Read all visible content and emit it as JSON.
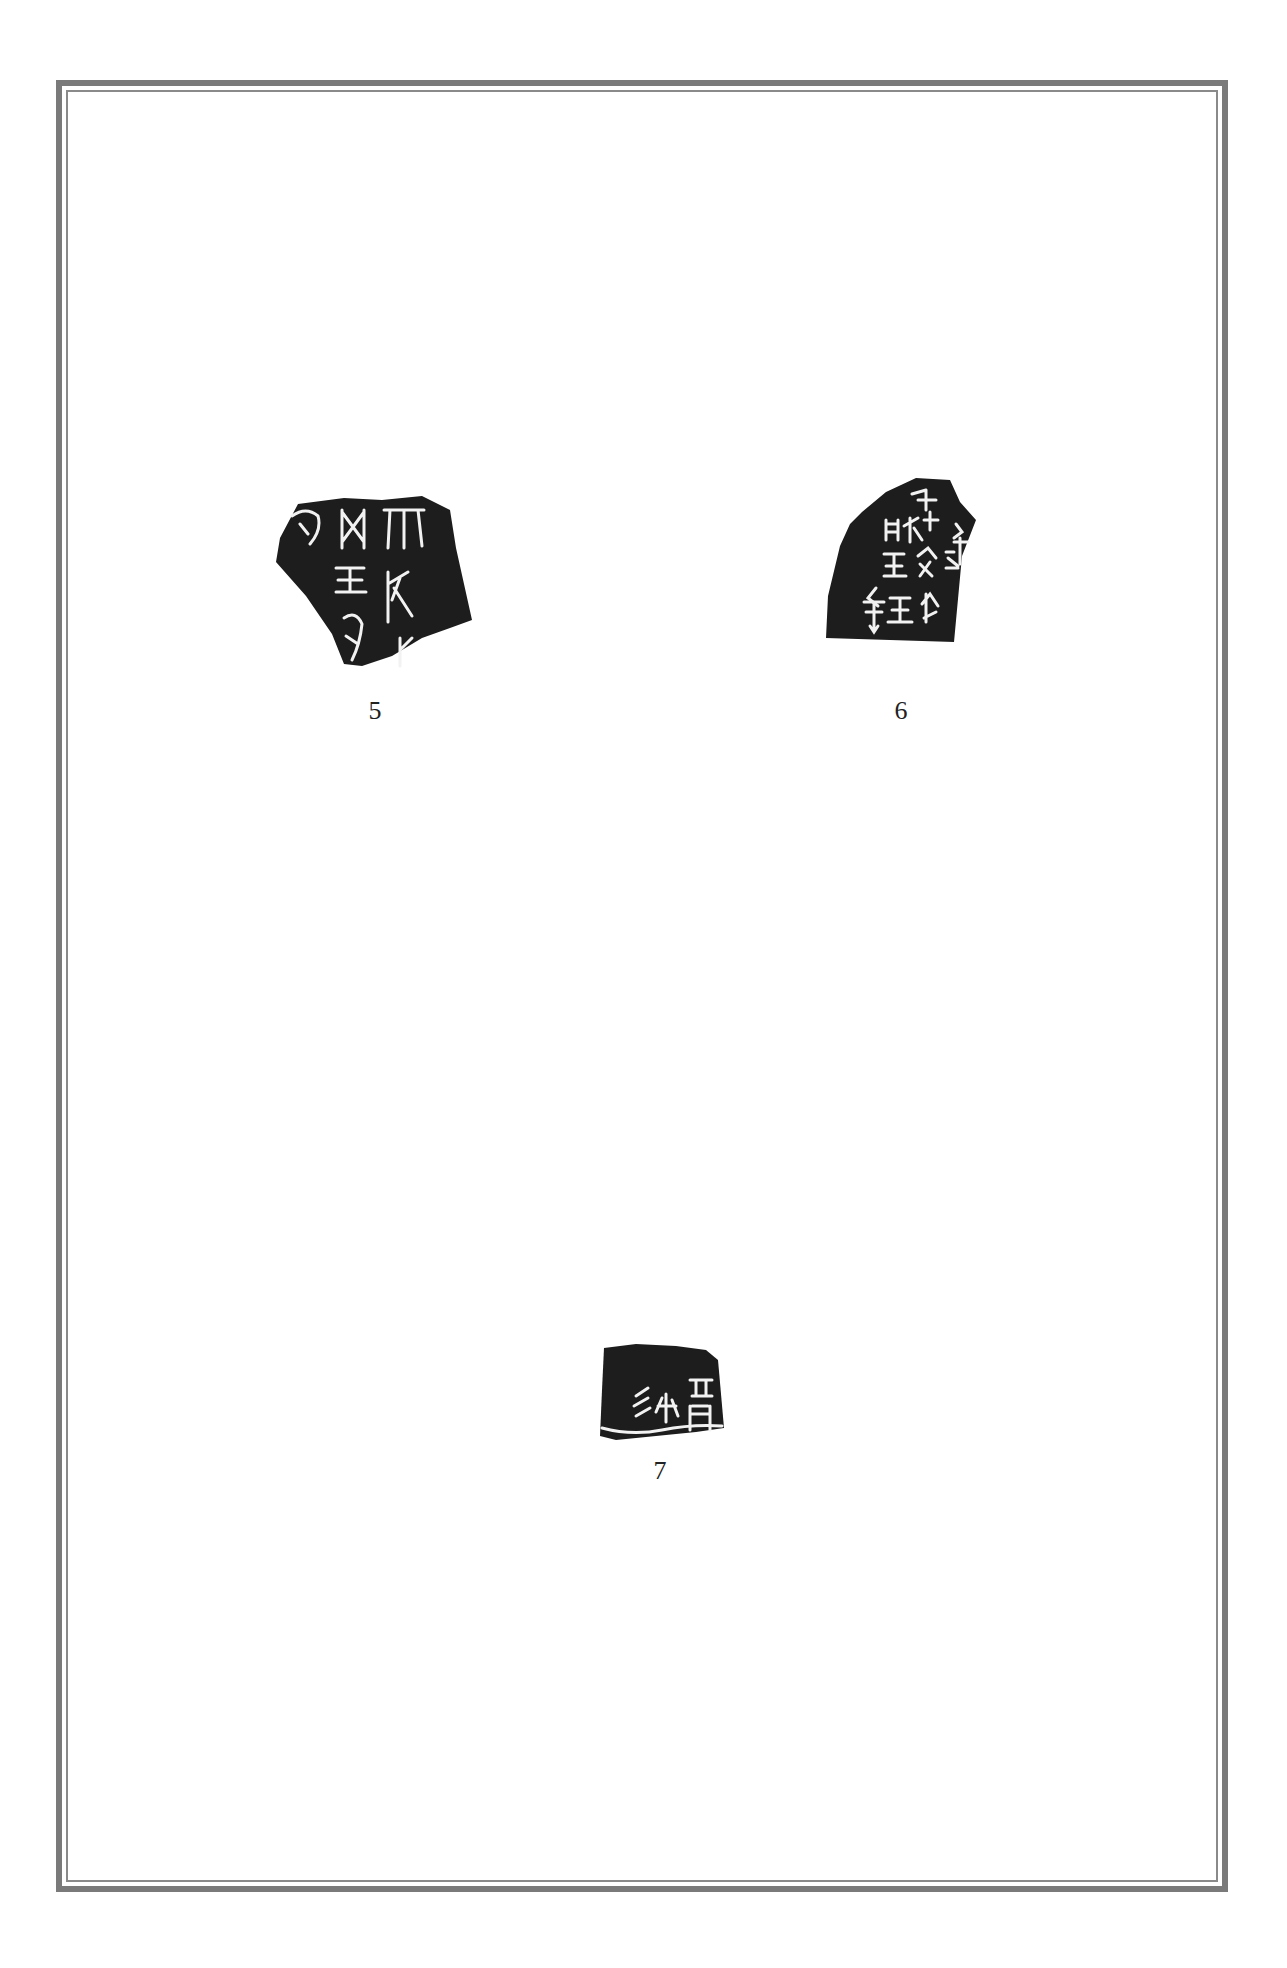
{
  "page": {
    "background": "#ffffff",
    "frame_color": "#7a7a7a"
  },
  "figures": [
    {
      "number": "5",
      "description": "Oracle bone rubbing fragment with incised characters in three columns",
      "ink_color": "#1c1c1c"
    },
    {
      "number": "6",
      "description": "Oracle bone rubbing fragment with incised characters in four columns",
      "ink_color": "#1c1c1c"
    },
    {
      "number": "7",
      "description": "Oracle bone rubbing fragment with three incised characters above a curved line",
      "ink_color": "#1c1c1c"
    }
  ]
}
